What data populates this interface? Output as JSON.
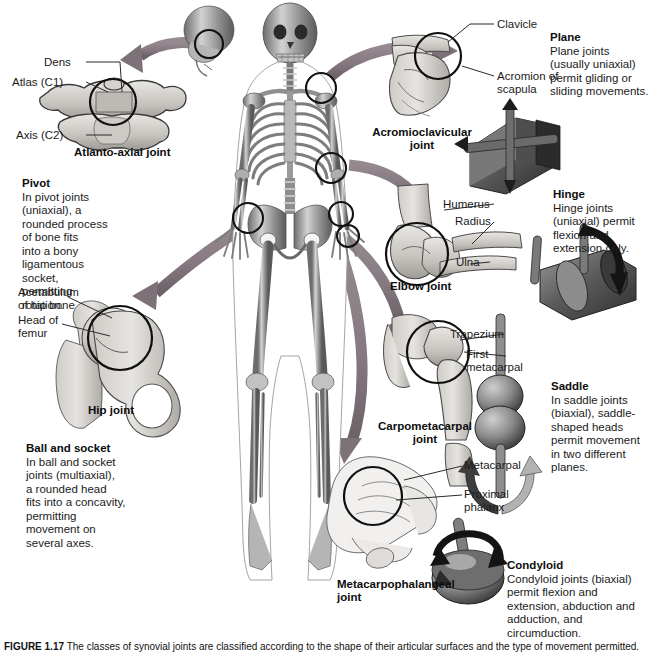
{
  "figure": {
    "caption_label": "FIGURE 1.17",
    "caption_text": "  The classes of synovial joints are classified according to the shape of their articular surfaces and the type of movement permitted."
  },
  "central": {
    "name": "human-skeleton-anterior-view",
    "joint_markers": [
      "atlanto-axial-marker",
      "acromioclavicular-marker",
      "elbow-marker",
      "hip-marker",
      "carpometacarpal-marker",
      "metacarpophalangeal-marker"
    ]
  },
  "panels": {
    "atlanto_axial": {
      "title": "Atlanto-axial joint",
      "labels": {
        "dens": "Dens",
        "atlas": "Atlas (C1)",
        "axis": "Axis (C2)"
      }
    },
    "pivot": {
      "title": "Pivot",
      "body": "In pivot joints\n(uniaxial), a\nrounded process\nof bone fits\ninto a bony\nligamentous\nsocket, permitting\nrotation.",
      "model": "pivot-joint-model"
    },
    "hip": {
      "title": "Hip joint",
      "labels": {
        "acetabulum": "Acetabulum\nof hip bone",
        "head_of_femur": "Head of\nfemur"
      }
    },
    "ball_and_socket": {
      "title": "Ball and socket",
      "body": "In ball and socket\njoints (multiaxial),\na rounded head\nfits into a concavity,\npermitting\nmovement on\nseveral axes.",
      "model": "ball-and-socket-joint-model"
    },
    "acromioclavicular": {
      "title": "Acromioclavicular\njoint",
      "labels": {
        "clavicle": "Clavicle",
        "acromion": "Acromion of\nscapula"
      }
    },
    "plane": {
      "title": "Plane",
      "body": "Plane joints\n(usually uniaxial)\npermit gliding or\nsliding movements.",
      "model": "plane-joint-model"
    },
    "elbow": {
      "title": "Elbow joint",
      "labels": {
        "humerus": "Humerus",
        "radius": "Radius",
        "ulna": "Ulna"
      }
    },
    "hinge": {
      "title": "Hinge",
      "body": "Hinge joints\n(uniaxial) permit\nflexion and\nextension only.",
      "model": "hinge-joint-model"
    },
    "carpometacarpal": {
      "title": "Carpometacarpal\njoint",
      "labels": {
        "trapezium": "Trapezium",
        "first_metacarpal": "First\nmetacarpal"
      }
    },
    "saddle": {
      "title": "Saddle",
      "body": "In saddle joints\n(biaxial), saddle-\nshaped heads\npermit movement\nin two different\nplanes.",
      "model": "saddle-joint-model"
    },
    "metacarpophalangeal": {
      "title": "Metacarpophalangeal\njoint",
      "labels": {
        "metacarpal": "Metacarpal",
        "proximal_phalanx": "Proximal\nphalanx"
      }
    },
    "condyloid": {
      "title": "Condyloid",
      "body": "Condyloid joints (biaxial)\npermit flexion and\nextension, abduction and\nadduction, and circumduction.",
      "model": "condyloid-joint-model"
    }
  },
  "colors": {
    "arrow": "#8a7d84",
    "arrow_dark": "#6f6269",
    "bone_light": "#d8d6d2",
    "bone_mid": "#b9b6b1",
    "bone_dark": "#8e8b86",
    "model_dark": "#3a3a3a",
    "model_mid": "#6e6e6e",
    "model_light": "#a9a9a9",
    "text": "#1b1b1b",
    "background": "#ffffff"
  }
}
